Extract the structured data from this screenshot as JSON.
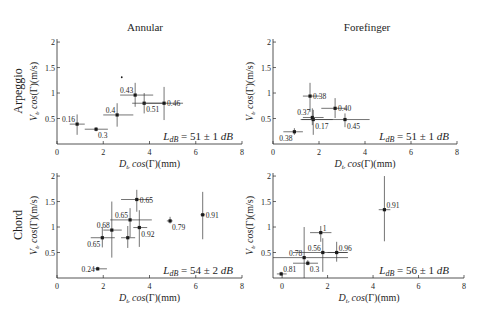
{
  "figure": {
    "col_titles": [
      "Annular",
      "Forefinger"
    ],
    "row_labels": [
      "Arpeggio",
      "Chord"
    ]
  },
  "chart_data": [
    {
      "type": "scatter",
      "row": "Arpeggio",
      "col": "Annular",
      "xlabel": "D_{t_r} cos(Γ)(mm)",
      "ylabel": "V_{t_r} cos(Γ)(m/s)",
      "xlabel_parts": {
        "var": "D",
        "sub": "t",
        "subsub": "r",
        "func": "cos",
        "rest": "(Γ)(mm)"
      },
      "ylabel_parts": {
        "var": "V",
        "sub": "t",
        "subsub": "r",
        "func": "cos",
        "rest": "(Γ)(m/s)"
      },
      "xlim": [
        0,
        8
      ],
      "ylim": [
        0,
        2.06
      ],
      "xticks": [
        0,
        2,
        4,
        6,
        8
      ],
      "yticks": [
        0.5,
        1,
        1.5,
        2
      ],
      "ytick_labels": [
        "0.5",
        "1",
        "1.5",
        "2"
      ],
      "grid": false,
      "annotation": "L_dB = 51 ± 1 dB",
      "annotation_parts": {
        "lhs": "L",
        "lhs_sub": "dB",
        "rhs": " = 51 ± 1 ",
        "unit": "dB"
      },
      "points": [
        {
          "x": 0.87,
          "y": 0.39,
          "xerr": [
            0.55,
            1.2
          ],
          "yerr": [
            0.18,
            0.58
          ],
          "label": "0.16",
          "label_pos": "upper-left"
        },
        {
          "x": 1.69,
          "y": 0.29,
          "xerr": [
            1.2,
            2.2
          ],
          "yerr": [
            0.25,
            0.33
          ],
          "label": "0.3",
          "label_pos": "lower-right"
        },
        {
          "x": 2.6,
          "y": 0.57,
          "xerr": [
            2.0,
            3.3
          ],
          "yerr": [
            0.34,
            0.8
          ],
          "label": "0.4",
          "label_pos": "upper-left"
        },
        {
          "x": 3.38,
          "y": 0.96,
          "xerr": [
            2.73,
            4.16
          ],
          "yerr": [
            0.73,
            1.2
          ],
          "label": "0.43",
          "label_pos": "upper-left"
        },
        {
          "x": 3.77,
          "y": 0.8,
          "xerr": [
            3.25,
            4.68
          ],
          "yerr": [
            0.6,
            1.0
          ],
          "label": "0.51",
          "label_pos": "lower-right"
        },
        {
          "x": 4.63,
          "y": 0.8,
          "xerr": [
            3.7,
            5.45
          ],
          "yerr": [
            0.47,
            1.12
          ],
          "label": "0.46",
          "label_pos": "right"
        }
      ],
      "stray_markers": [
        {
          "x": 2.8,
          "y": 1.31
        }
      ]
    },
    {
      "type": "scatter",
      "row": "Arpeggio",
      "col": "Forefinger",
      "xlabel": "D_{t_r} cos(Γ)(mm)",
      "ylabel": "V_{t_r} cos(Γ)(m/s)",
      "xlabel_parts": {
        "var": "D",
        "sub": "t",
        "subsub": "r",
        "func": "cos",
        "rest": "(Γ)(mm)"
      },
      "ylabel_parts": {
        "var": "V",
        "sub": "t",
        "subsub": "r",
        "func": "cos",
        "rest": "(Γ)(m/s)"
      },
      "xlim": [
        0,
        8
      ],
      "ylim": [
        0,
        2.06
      ],
      "xticks": [
        0,
        2,
        4,
        6,
        8
      ],
      "yticks": [
        0.5,
        1,
        1.5,
        2
      ],
      "ytick_labels": [
        "0.5",
        "1",
        "1.5",
        "2"
      ],
      "grid": false,
      "annotation": "L_dB = 51 ± 1 dB",
      "annotation_parts": {
        "lhs": "L",
        "lhs_sub": "dB",
        "rhs": " = 51 ± 1 ",
        "unit": "dB"
      },
      "points": [
        {
          "x": 0.93,
          "y": 0.24,
          "xerr": [
            0.45,
            1.3
          ],
          "yerr": [
            0.18,
            0.31
          ],
          "label": "0.38",
          "label_pos": "lower-left"
        },
        {
          "x": 1.61,
          "y": 0.94,
          "xerr": [
            1.3,
            2.04
          ],
          "yerr": [
            0.63,
            1.2
          ],
          "label": "0.38",
          "label_pos": "right"
        },
        {
          "x": 1.71,
          "y": 0.52,
          "xerr": [
            1.3,
            2.2
          ],
          "yerr": [
            0.37,
            0.7
          ],
          "label": "0.37",
          "label_pos": "upper-left"
        },
        {
          "x": 1.75,
          "y": 0.48,
          "xerr": [
            1.2,
            2.6
          ],
          "yerr": [
            0.18,
            0.67
          ],
          "label": "0.17",
          "label_pos": "lower-right"
        },
        {
          "x": 2.7,
          "y": 0.7,
          "xerr": [
            2.1,
            3.2
          ],
          "yerr": [
            0.51,
            0.9
          ],
          "label": "0.40",
          "label_pos": "right"
        },
        {
          "x": 3.13,
          "y": 0.48,
          "xerr": [
            1.25,
            4.2
          ],
          "yerr": [
            0.33,
            0.6
          ],
          "label": "0.45",
          "label_pos": "lower-right"
        }
      ],
      "stray_markers": []
    },
    {
      "type": "scatter",
      "row": "Chord",
      "col": "Annular",
      "xlabel": "D_{t_r} cos(Γ)(mm)",
      "ylabel": "V_{t_r} cos(Γ)(m/s)",
      "xlabel_parts": {
        "var": "D",
        "sub": "t",
        "subsub": "r",
        "func": "cos",
        "rest": "(Γ)(mm)"
      },
      "ylabel_parts": {
        "var": "V",
        "sub": "t",
        "subsub": "r",
        "func": "cos",
        "rest": "(Γ)(m/s)"
      },
      "xlim": [
        0,
        8
      ],
      "ylim": [
        0,
        2.06
      ],
      "xticks": [
        0,
        2,
        4,
        6,
        8
      ],
      "yticks": [
        0.5,
        1,
        1.5,
        2
      ],
      "ytick_labels": [
        "0.5",
        "1",
        "1.5",
        "2"
      ],
      "grid": false,
      "annotation": "L_dB = 54 ± 2 dB",
      "annotation_parts": {
        "lhs": "L",
        "lhs_sub": "dB",
        "rhs": " = 54 ± 2 ",
        "unit": "dB"
      },
      "points": [
        {
          "x": 1.76,
          "y": 0.18,
          "xerr": [
            1.56,
            2.16
          ],
          "yerr": [
            0.15,
            0.22
          ],
          "label": "0.24",
          "label_pos": "left"
        },
        {
          "x": 1.96,
          "y": 0.79,
          "xerr": [
            1.46,
            2.5
          ],
          "yerr": [
            0.6,
            1.0
          ],
          "label": "0.65",
          "label_pos": "lower-left"
        },
        {
          "x": 2.37,
          "y": 0.94,
          "xerr": [
            2.0,
            2.8
          ],
          "yerr": [
            0.4,
            1.5
          ],
          "label": "0.68",
          "label_pos": "upper-left"
        },
        {
          "x": 3.16,
          "y": 1.14,
          "xerr": [
            2.3,
            4.1
          ],
          "yerr": [
            0.8,
            1.37
          ],
          "label": "0.65",
          "label_pos": "upper-left"
        },
        {
          "x": 3.06,
          "y": 0.79,
          "xerr": [
            2.77,
            3.38
          ],
          "yerr": [
            0.59,
            1.02
          ],
          "label": "",
          "label_pos": "none"
        },
        {
          "x": 3.56,
          "y": 0.99,
          "xerr": [
            3.3,
            3.9
          ],
          "yerr": [
            0.61,
            1.33
          ],
          "label": "0.92",
          "label_pos": "lower-right"
        },
        {
          "x": 3.45,
          "y": 1.54,
          "xerr": [
            2.77,
            4.1
          ],
          "yerr": [
            1.3,
            1.73
          ],
          "label": "0.65",
          "label_pos": "right"
        },
        {
          "x": 4.89,
          "y": 1.12,
          "xerr": [
            4.75,
            5.0
          ],
          "yerr": [
            1.07,
            1.2
          ],
          "label": "0.79",
          "label_pos": "lower-right"
        },
        {
          "x": 6.3,
          "y": 1.24,
          "xerr": [
            6.2,
            6.4
          ],
          "yerr": [
            0.76,
            1.69
          ],
          "label": "0.91",
          "label_pos": "right"
        }
      ],
      "stray_markers": []
    },
    {
      "type": "scatter",
      "row": "Chord",
      "col": "Forefinger",
      "xlabel": "D_{t_r} cos(Γ)(mm)",
      "ylabel": "V_{t_r} cos(Γ)(m/s)",
      "xlabel_parts": {
        "var": "D",
        "sub": "t",
        "subsub": "r",
        "func": "cos",
        "rest": "(Γ)(mm)"
      },
      "ylabel_parts": {
        "var": "V",
        "sub": "t",
        "subsub": "r",
        "func": "cos",
        "rest": "(Γ)(m/s)"
      },
      "xlim": [
        -0.4,
        8
      ],
      "ylim": [
        0,
        2.06
      ],
      "xticks": [
        0,
        2,
        4,
        6,
        8
      ],
      "yticks": [
        0.5,
        1,
        1.5,
        2
      ],
      "ytick_labels": [
        "0.5",
        "1",
        "1.5",
        "2"
      ],
      "grid": false,
      "annotation": "L_dB = 56 ± 1 dB",
      "annotation_parts": {
        "lhs": "L",
        "lhs_sub": "dB",
        "rhs": " = 56 ± 1 ",
        "unit": "dB"
      },
      "points": [
        {
          "x": -0.04,
          "y": 0.08,
          "xerr": [
            -0.23,
            0.2
          ],
          "yerr": [
            0.05,
            0.12
          ],
          "label": "0.81",
          "label_pos": "upper-right"
        },
        {
          "x": 0.97,
          "y": 0.4,
          "xerr": [
            -0.4,
            2.9
          ],
          "yerr": [
            0.0,
            1.0
          ],
          "label": "0.78",
          "label_pos": "upper-left"
        },
        {
          "x": 1.13,
          "y": 0.29,
          "xerr": [
            0.48,
            1.58
          ],
          "yerr": [
            0.25,
            0.35
          ],
          "label": "0.3",
          "label_pos": "lower-right"
        },
        {
          "x": 1.7,
          "y": 0.89,
          "xerr": [
            1.23,
            2.17
          ],
          "yerr": [
            0.71,
            1.02
          ],
          "label": "1",
          "label_pos": "upper-right"
        },
        {
          "x": 1.79,
          "y": 0.5,
          "xerr": [
            0.48,
            2.85
          ],
          "yerr": [
            0.12,
            0.78
          ],
          "label": "0.56",
          "label_pos": "upper-left"
        },
        {
          "x": 2.4,
          "y": 0.5,
          "xerr": [
            2.0,
            2.9
          ],
          "yerr": [
            0.32,
            0.71
          ],
          "label": "0.96",
          "label_pos": "upper-right"
        },
        {
          "x": 4.5,
          "y": 1.34,
          "xerr": [
            4.25,
            4.76
          ],
          "yerr": [
            0.72,
            2.0
          ],
          "label": "0.91",
          "label_pos": "upper-right"
        }
      ],
      "stray_markers": []
    }
  ]
}
